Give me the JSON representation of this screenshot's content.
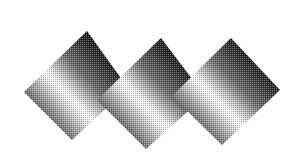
{
  "canvas": {
    "width": 304,
    "height": 161,
    "background_color": "#ffffff",
    "title": "Three overlapping gradient diamond tiles"
  },
  "render": {
    "texture": "halftone-dither",
    "dither_opacity": 0.26,
    "dither_cell": 2,
    "edge_softness": 0.6
  },
  "palette": {
    "dark": "#080808",
    "mid_dark": "#2e2e2e",
    "mid": "#777777",
    "light": "#e8e8e8",
    "highlight": "#ffffff",
    "background": "#ffffff"
  },
  "gradient": {
    "name": "diagonal-specular-band",
    "angle_deg": 45,
    "stops": [
      {
        "offset": 0.0,
        "color": "#050505"
      },
      {
        "offset": 0.1,
        "color": "#0b0b0b"
      },
      {
        "offset": 0.26,
        "color": "#2a2a2a"
      },
      {
        "offset": 0.42,
        "color": "#6e6e6e"
      },
      {
        "offset": 0.52,
        "color": "#c9c9c9"
      },
      {
        "offset": 0.58,
        "color": "#ffffff"
      },
      {
        "offset": 0.64,
        "color": "#d8d8d8"
      },
      {
        "offset": 0.76,
        "color": "#7a7a7a"
      },
      {
        "offset": 0.88,
        "color": "#303030"
      },
      {
        "offset": 1.0,
        "color": "#070707"
      }
    ]
  },
  "shapes": [
    {
      "id": "diamond-left",
      "label": "Diamond 1 (left)",
      "points": [
        [
          24,
          92
        ],
        [
          87,
          31
        ],
        [
          128,
          88
        ],
        [
          72,
          140
        ]
      ],
      "gradient_ref": "diagonal-specular-band",
      "z": 1
    },
    {
      "id": "diamond-center",
      "label": "Diamond 2 (center)",
      "points": [
        [
          97,
          100
        ],
        [
          161,
          38
        ],
        [
          205,
          96
        ],
        [
          146,
          149
        ]
      ],
      "gradient_ref": "diagonal-specular-band",
      "z": 2
    },
    {
      "id": "diamond-right",
      "label": "Diamond 3 (right)",
      "points": [
        [
          172,
          96
        ],
        [
          231,
          38
        ],
        [
          280,
          90
        ],
        [
          222,
          145
        ]
      ],
      "gradient_ref": "diagonal-specular-band",
      "z": 3
    }
  ]
}
